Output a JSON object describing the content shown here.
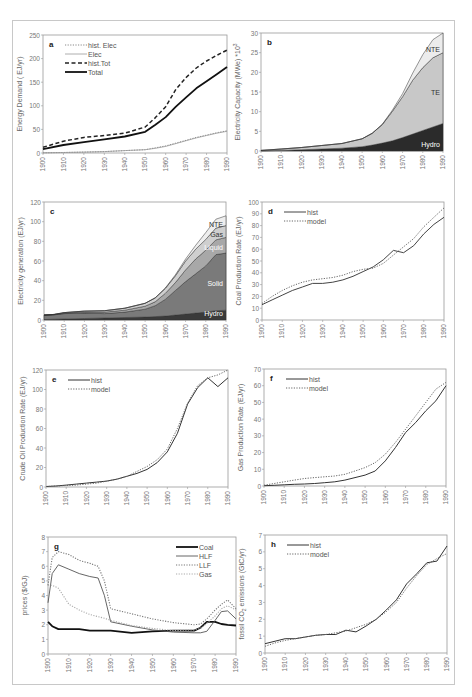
{
  "figure": {
    "panel_count": 8,
    "x_range": [
      1900,
      1990
    ],
    "x_ticks": [
      1900,
      1910,
      1920,
      1930,
      1940,
      1950,
      1960,
      1970,
      1980,
      1990
    ]
  },
  "chart_data": [
    {
      "id": "a",
      "label": "a",
      "type": "line",
      "ylabel": "Energy Demand ( EJ/yr)",
      "ylim": [
        0,
        250
      ],
      "yticks": [
        0,
        50,
        100,
        150,
        200,
        250
      ],
      "legend_position": "top-left",
      "box": {
        "x": 43,
        "y": 35,
        "w": 184,
        "h": 118
      },
      "x": [
        1900,
        1910,
        1920,
        1930,
        1940,
        1950,
        1955,
        1960,
        1965,
        1970,
        1975,
        1980,
        1985,
        1990
      ],
      "series": [
        {
          "name": "hist. Elec",
          "style": "dotted",
          "width": 1,
          "color": "#888888",
          "values": [
            0.5,
            1,
            2,
            3,
            5,
            7,
            11,
            15,
            21,
            27,
            33,
            38,
            43,
            47
          ]
        },
        {
          "name": "Elec",
          "style": "solid",
          "width": 0.8,
          "color": "#999999",
          "values": [
            0.5,
            1,
            2,
            3,
            5,
            7,
            10,
            14,
            20,
            26,
            32,
            37,
            42,
            46
          ]
        },
        {
          "name": "hist.Tot",
          "style": "dashed",
          "width": 1.5,
          "color": "#222222",
          "values": [
            12,
            25,
            33,
            37,
            42,
            55,
            75,
            98,
            135,
            160,
            180,
            195,
            207,
            218
          ]
        },
        {
          "name": "Total",
          "style": "solid",
          "width": 1.8,
          "color": "#111111",
          "values": [
            8,
            17,
            23,
            29,
            35,
            45,
            60,
            76,
            98,
            118,
            137,
            152,
            167,
            182
          ]
        }
      ]
    },
    {
      "id": "b",
      "label": "b",
      "type": "area",
      "ylabel": "Electricity Capacity (MWe) *10^3",
      "ylabel_main": "Electricity Capacity (MWe) *10",
      "ylabel_sup": "3",
      "ylim": [
        0,
        30
      ],
      "yticks": [
        0,
        5,
        10,
        15,
        20,
        25,
        30
      ],
      "box": {
        "x": 261,
        "y": 33,
        "w": 182,
        "h": 118
      },
      "x": [
        1900,
        1910,
        1920,
        1930,
        1940,
        1950,
        1955,
        1960,
        1965,
        1970,
        1975,
        1980,
        1985,
        1990
      ],
      "series": [
        {
          "name": "Hydro",
          "color": "#2b2b2b",
          "label_color": "#ffffff",
          "values": [
            0.05,
            0.15,
            0.3,
            0.5,
            0.7,
            1.1,
            1.5,
            2.0,
            2.6,
            3.4,
            4.3,
            5.2,
            6.1,
            7.0
          ]
        },
        {
          "name": "TE",
          "color": "#c8c8c8",
          "label_color": "#333333",
          "values": [
            0.1,
            0.35,
            0.6,
            0.9,
            1.2,
            2.0,
            3.0,
            4.7,
            7.5,
            10.4,
            13.7,
            16.0,
            17.6,
            18.0
          ]
        },
        {
          "name": "NTE",
          "color": "#ececec",
          "label_color": "#333333",
          "values": [
            0,
            0,
            0,
            0,
            0,
            0,
            0,
            0.1,
            0.3,
            0.8,
            1.8,
            3.3,
            4.6,
            5.0
          ]
        }
      ]
    },
    {
      "id": "c",
      "label": "c",
      "type": "area",
      "ylabel": "Electricity generation (EJ/yr)",
      "ylim": [
        0,
        120
      ],
      "yticks": [
        0,
        20,
        40,
        60,
        80,
        100,
        120
      ],
      "box": {
        "x": 44,
        "y": 202,
        "w": 182,
        "h": 118
      },
      "x": [
        1900,
        1905,
        1910,
        1920,
        1930,
        1940,
        1950,
        1955,
        1960,
        1965,
        1970,
        1975,
        1980,
        1985,
        1990
      ],
      "series": [
        {
          "name": "Hydro",
          "color": "#3a3a3a",
          "label_color": "#ffffff",
          "values": [
            0.5,
            0.8,
            1,
            1.5,
            2,
            2.5,
            3,
            3.5,
            4,
            5,
            6,
            7,
            8,
            9.5,
            10
          ]
        },
        {
          "name": "Solid",
          "color": "#7a7a7a",
          "label_color": "#ffffff",
          "values": [
            4.5,
            4.5,
            5.5,
            5.5,
            4.5,
            5.5,
            8,
            11,
            17,
            25,
            33,
            40,
            47,
            57,
            58
          ]
        },
        {
          "name": "Liquid",
          "color": "#a8a8a8",
          "label_color": "#ffffff",
          "values": [
            0,
            0.2,
            0.5,
            1,
            1.5,
            2,
            3,
            4,
            6,
            8,
            12,
            15,
            16,
            15,
            16
          ]
        },
        {
          "name": "Gas",
          "color": "#cfcfcf",
          "label_color": "#333333",
          "values": [
            0,
            0.2,
            0.5,
            1,
            1.5,
            2,
            3,
            4,
            5,
            7,
            9,
            10,
            11,
            12,
            12
          ]
        },
        {
          "name": "NTE",
          "color": "#eeeeee",
          "label_color": "#333333",
          "values": [
            0,
            0,
            0,
            0,
            0,
            0,
            0,
            0,
            0.5,
            1,
            2,
            4,
            7,
            9,
            10
          ]
        }
      ]
    },
    {
      "id": "d",
      "label": "d",
      "type": "line",
      "ylabel": "Coal Production Rate (EJ/yr)",
      "ylim": [
        0,
        100
      ],
      "yticks": [
        0,
        10,
        20,
        30,
        40,
        50,
        60,
        70,
        80,
        90,
        100
      ],
      "box": {
        "x": 262,
        "y": 202,
        "w": 182,
        "h": 118
      },
      "x": [
        1900,
        1905,
        1910,
        1915,
        1920,
        1925,
        1930,
        1935,
        1940,
        1945,
        1950,
        1955,
        1960,
        1965,
        1970,
        1975,
        1980,
        1985,
        1990
      ],
      "series": [
        {
          "name": "hist",
          "style": "solid",
          "width": 1,
          "color": "#444444",
          "values": [
            13,
            17,
            21,
            25,
            28,
            31,
            31,
            32,
            34,
            37,
            41,
            45,
            51,
            59,
            57,
            63,
            73,
            81,
            87
          ]
        },
        {
          "name": "model",
          "style": "dotted",
          "width": 1,
          "color": "#666666",
          "values": [
            14,
            20,
            25,
            29,
            32,
            34,
            35,
            36,
            38,
            41,
            43,
            44,
            48,
            55,
            62,
            69,
            79,
            87,
            95
          ]
        }
      ]
    },
    {
      "id": "e",
      "label": "e",
      "type": "line",
      "ylabel": "Crude Oil Production Rate (EJ/yr)",
      "ylim": [
        0,
        120
      ],
      "yticks": [
        0,
        20,
        40,
        60,
        80,
        100,
        120
      ],
      "box": {
        "x": 46,
        "y": 370,
        "w": 182,
        "h": 117
      },
      "x": [
        1900,
        1905,
        1910,
        1915,
        1920,
        1925,
        1930,
        1935,
        1940,
        1945,
        1950,
        1955,
        1960,
        1965,
        1970,
        1975,
        1980,
        1985,
        1990
      ],
      "series": [
        {
          "name": "hist",
          "style": "solid",
          "width": 1,
          "color": "#333333",
          "values": [
            0.5,
            1,
            2,
            3,
            4,
            5,
            6,
            8,
            11,
            14,
            18,
            25,
            36,
            55,
            85,
            102,
            112,
            103,
            112
          ]
        },
        {
          "name": "model",
          "style": "dotted",
          "width": 1,
          "color": "#666666",
          "values": [
            0.5,
            1,
            1.5,
            2,
            3,
            4,
            6,
            8,
            11,
            16,
            21,
            28,
            39,
            60,
            86,
            104,
            112,
            115,
            120
          ]
        }
      ]
    },
    {
      "id": "f",
      "label": "f",
      "type": "line",
      "ylabel": "Gas Production Rate (EJ/yr)",
      "ylim": [
        0,
        70
      ],
      "yticks": [
        0,
        10,
        20,
        30,
        40,
        50,
        60,
        70
      ],
      "box": {
        "x": 264,
        "y": 369,
        "w": 182,
        "h": 117
      },
      "x": [
        1900,
        1905,
        1910,
        1915,
        1920,
        1925,
        1930,
        1935,
        1940,
        1945,
        1950,
        1955,
        1960,
        1965,
        1970,
        1975,
        1980,
        1985,
        1990
      ],
      "series": [
        {
          "name": "hist",
          "style": "solid",
          "width": 1,
          "color": "#333333",
          "values": [
            0.2,
            0.4,
            0.7,
            1,
            1.2,
            1.5,
            2,
            2.5,
            3.5,
            5,
            6.5,
            9,
            15,
            23,
            32,
            38,
            45,
            51,
            60
          ]
        },
        {
          "name": "model",
          "style": "dotted",
          "width": 1,
          "color": "#666666",
          "values": [
            0.5,
            1.5,
            2.5,
            3.5,
            4.5,
            5,
            5.5,
            6,
            7,
            9,
            11,
            14,
            19,
            26,
            34,
            42,
            50,
            58,
            62
          ]
        }
      ]
    },
    {
      "id": "g",
      "label": "g",
      "type": "line",
      "ylabel": "prices ($/GJ)",
      "ylim": [
        0,
        8
      ],
      "yticks": [
        0,
        1,
        2,
        3,
        4,
        5,
        6,
        7,
        8
      ],
      "legend_position": "top-right",
      "box": {
        "x": 48,
        "y": 537,
        "w": 188,
        "h": 117
      },
      "x": [
        1900,
        1902,
        1905,
        1910,
        1915,
        1920,
        1924,
        1927,
        1930,
        1940,
        1950,
        1960,
        1970,
        1973,
        1976,
        1980,
        1983,
        1986,
        1990
      ],
      "series": [
        {
          "name": "Coal",
          "style": "solid",
          "width": 1.8,
          "color": "#111111",
          "values": [
            2.2,
            1.9,
            1.7,
            1.7,
            1.7,
            1.6,
            1.6,
            1.6,
            1.6,
            1.45,
            1.55,
            1.6,
            1.6,
            1.8,
            2.2,
            2.2,
            2.05,
            2.0,
            1.95
          ]
        },
        {
          "name": "HLF",
          "style": "solid",
          "width": 0.9,
          "color": "#555555",
          "values": [
            3.5,
            5.5,
            6.1,
            5.8,
            5.5,
            5.3,
            5.2,
            4.0,
            2.2,
            1.9,
            1.65,
            1.5,
            1.45,
            1.45,
            1.55,
            2.3,
            2.9,
            2.95,
            2.4
          ]
        },
        {
          "name": "LLF",
          "style": "dotted",
          "width": 1.1,
          "color": "#777777",
          "values": [
            4.7,
            6.6,
            7.0,
            6.8,
            6.4,
            6.2,
            6.0,
            5.0,
            3.1,
            2.75,
            2.4,
            2.15,
            2.0,
            2.05,
            2.4,
            3.0,
            3.4,
            3.7,
            3.1
          ]
        },
        {
          "name": "Gas",
          "style": "dotted",
          "width": 1.1,
          "color": "#aaaaaa",
          "values": [
            4.7,
            4.7,
            4.5,
            3.4,
            3.0,
            2.7,
            2.55,
            2.45,
            2.3,
            1.95,
            1.75,
            1.6,
            1.65,
            1.75,
            2.1,
            2.6,
            3.1,
            3.3,
            3.0
          ]
        }
      ]
    },
    {
      "id": "h",
      "label": "h",
      "type": "line",
      "ylabel": "fossil CO2 emissions (GtC/yr)",
      "ylabel_main": "fossil CO",
      "ylabel_sub": "2",
      "ylabel_tail": " emissions (GtC/yr)",
      "ylim": [
        0,
        7
      ],
      "yticks": [
        0,
        1,
        2,
        3,
        4,
        5,
        6,
        7
      ],
      "box": {
        "x": 265,
        "y": 535,
        "w": 182,
        "h": 118
      },
      "x": [
        1900,
        1905,
        1910,
        1915,
        1920,
        1925,
        1930,
        1935,
        1940,
        1945,
        1950,
        1955,
        1960,
        1965,
        1970,
        1975,
        1980,
        1985,
        1990
      ],
      "series": [
        {
          "name": "hist",
          "style": "solid",
          "width": 1,
          "color": "#333333",
          "values": [
            0.55,
            0.7,
            0.85,
            0.85,
            0.95,
            1.05,
            1.1,
            1.1,
            1.35,
            1.25,
            1.6,
            2.0,
            2.55,
            3.15,
            4.1,
            4.7,
            5.35,
            5.45,
            6.35
          ]
        },
        {
          "name": "model",
          "style": "dotted",
          "width": 1,
          "color": "#666666",
          "values": [
            0.4,
            0.6,
            0.75,
            0.85,
            0.95,
            1.05,
            1.1,
            1.2,
            1.3,
            1.5,
            1.7,
            2.0,
            2.45,
            3.0,
            3.85,
            4.6,
            5.25,
            5.6,
            5.9
          ]
        }
      ]
    }
  ]
}
